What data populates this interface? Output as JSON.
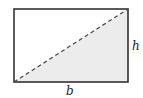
{
  "diagram": {
    "type": "rectangle-with-diagonal",
    "labels": {
      "height": "h",
      "base": "b"
    },
    "colors": {
      "stroke": "#333333",
      "shade": "#ececec",
      "diagonal": "#444444"
    }
  }
}
